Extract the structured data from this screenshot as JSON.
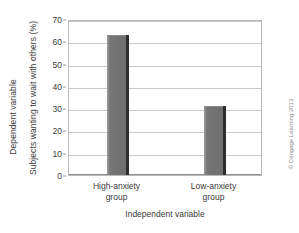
{
  "chart_data": {
    "type": "bar",
    "title": "",
    "categories": [
      "High-anxiety group",
      "Low-anxiety group"
    ],
    "values": [
      63,
      31
    ],
    "xlabel": "Independent variable",
    "ylabel": "Subjects wanting to wait with others (%)",
    "ylim": [
      0,
      70
    ],
    "ytick_labels": [
      "0",
      "10",
      "20",
      "30",
      "40",
      "50",
      "60",
      "70"
    ],
    "ytick_values": [
      0,
      10,
      20,
      30,
      40,
      50,
      60,
      70
    ],
    "grid": "horizontal",
    "legend": "none",
    "series": [
      {
        "name": "Subjects wanting to wait with others (%)",
        "values": [
          63,
          31
        ],
        "color": "#6e6e6e"
      }
    ],
    "category_lines": [
      [
        "High-anxiety",
        "group"
      ],
      [
        "Low-anxiety",
        "group"
      ]
    ]
  },
  "axes": {
    "outer_y_caption": "Dependent variable",
    "inner_y_label": "Subjects wanting to wait with others (%)",
    "x_title": "Independent variable"
  },
  "credit": {
    "text": "© Cengage Learning 2013"
  },
  "colors": {
    "bar_fill": "#6e6e6e",
    "bar_side": "#2e2e2e",
    "grid": "#c9c9c9",
    "frame": "#b9b9b9",
    "text": "#3b3b3b",
    "credit": "#8a8a8a",
    "background": "#ffffff"
  }
}
